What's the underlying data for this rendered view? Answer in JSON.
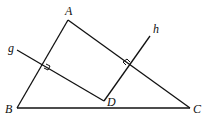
{
  "diagram": {
    "points": {
      "A": {
        "label": "A",
        "x": 68,
        "y": 20
      },
      "B": {
        "label": "B",
        "x": 17,
        "y": 108
      },
      "C": {
        "label": "C",
        "x": 190,
        "y": 108
      },
      "D": {
        "label": "D",
        "x": 104,
        "y": 101
      }
    },
    "lines": {
      "g": {
        "label": "g"
      },
      "h": {
        "label": "h"
      }
    },
    "segments": [
      "AB",
      "AC",
      "BC",
      "gD",
      "hD"
    ],
    "right_angles": [
      "g ⟂ AB",
      "h ⟂ AC"
    ]
  }
}
